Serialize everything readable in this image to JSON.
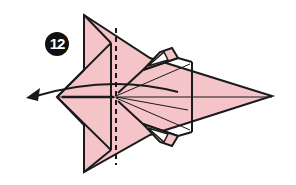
{
  "diagram": {
    "step_number": "12",
    "colors": {
      "paper": "#f5c4c8",
      "line": "#1a1a1a",
      "background": "#ffffff",
      "badge": "#111111",
      "badge_text": "#ffffff"
    },
    "elements": {
      "arrow": "curved-arrow-left",
      "valley_fold_line": "dashed-vertical",
      "shape": "pointed-body-with-side-pockets"
    }
  }
}
